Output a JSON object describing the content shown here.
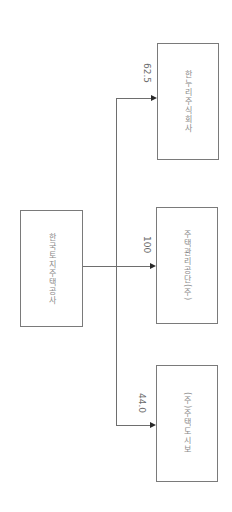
{
  "diagram": {
    "type": "ownership-tree",
    "orientation": "rotated-90-clockwise",
    "parent": {
      "label": "한국토지주택공사"
    },
    "children": [
      {
        "label": "한누리주식회사",
        "share": "62.5"
      },
      {
        "label": "주택관리공단(주)",
        "share": "100"
      },
      {
        "label": "(주)주택도시보",
        "share": "44.0"
      }
    ],
    "colors": {
      "box_border": "#7a7a7a",
      "text": "#8a8a8a",
      "line": "#6e6e6e",
      "arrow": "#2a2a2a"
    }
  }
}
